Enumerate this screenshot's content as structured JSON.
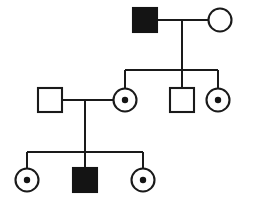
{
  "figure": {
    "type": "pedigree",
    "background_color": "#ffffff",
    "line_color": "#1a1a1a",
    "fill_affected_color": "#141414",
    "fill_unaffected_color": "#ffffff",
    "generations_count": "3",
    "inheritance_pattern": "X-linked recessive"
  },
  "legend": {
    "square_meaning": "male",
    "circle_meaning": "female",
    "filled_meaning": "affected",
    "open_meaning": "unaffected",
    "dot_meaning": "carrier"
  },
  "chart_data": {
    "type": "diagram",
    "generations": [
      {
        "id": "I",
        "label": "I",
        "y": 20,
        "individuals": [
          {
            "id": "I-1",
            "sex": "male",
            "shape": "square",
            "status": "affected",
            "carrier": "no",
            "fill": "#141414",
            "cx": 145,
            "cy": 20,
            "size": 24
          },
          {
            "id": "I-2",
            "sex": "female",
            "shape": "circle",
            "status": "unaffected",
            "carrier": "no",
            "fill": "#ffffff",
            "cx": 220,
            "cy": 20,
            "size": 24
          }
        ]
      },
      {
        "id": "II",
        "label": "II",
        "y": 100,
        "individuals": [
          {
            "id": "II-1",
            "sex": "male",
            "shape": "square",
            "status": "unaffected",
            "carrier": "no",
            "fill": "#ffffff",
            "cx": 50,
            "cy": 100,
            "size": 24
          },
          {
            "id": "II-2",
            "sex": "female",
            "shape": "circle",
            "status": "unaffected",
            "carrier": "yes",
            "fill": "#ffffff",
            "cx": 125,
            "cy": 100,
            "size": 24
          },
          {
            "id": "II-3",
            "sex": "male",
            "shape": "square",
            "status": "unaffected",
            "carrier": "no",
            "fill": "#ffffff",
            "cx": 182,
            "cy": 100,
            "size": 24
          },
          {
            "id": "II-4",
            "sex": "female",
            "shape": "circle",
            "status": "unaffected",
            "carrier": "yes",
            "fill": "#ffffff",
            "cx": 218,
            "cy": 100,
            "size": 24
          }
        ]
      },
      {
        "id": "III",
        "label": "III",
        "y": 180,
        "individuals": [
          {
            "id": "III-1",
            "sex": "female",
            "shape": "circle",
            "status": "unaffected",
            "carrier": "yes",
            "fill": "#ffffff",
            "cx": 27,
            "cy": 180,
            "size": 24
          },
          {
            "id": "III-2",
            "sex": "male",
            "shape": "square",
            "status": "affected",
            "carrier": "no",
            "fill": "#141414",
            "cx": 85,
            "cy": 180,
            "size": 24
          },
          {
            "id": "III-3",
            "sex": "female",
            "shape": "circle",
            "status": "unaffected",
            "carrier": "yes",
            "fill": "#ffffff",
            "cx": 143,
            "cy": 180,
            "size": 24
          }
        ]
      }
    ],
    "matings": [
      {
        "id": "mating-1",
        "partners": [
          "I-1",
          "I-2"
        ],
        "line_y": 20,
        "x_start": 157,
        "x_end": 208,
        "descent_x": 182,
        "descent_y_end": 70,
        "children": [
          "II-2",
          "II-3",
          "II-4"
        ],
        "sibship_bar_y": 70,
        "sibship_x_start": 125,
        "sibship_x_end": 218
      },
      {
        "id": "mating-2",
        "partners": [
          "II-1",
          "II-2"
        ],
        "line_y": 100,
        "x_start": 62,
        "x_end": 113,
        "descent_x": 85,
        "descent_y_end": 152,
        "children": [
          "III-1",
          "III-2",
          "III-3"
        ],
        "sibship_bar_y": 152,
        "sibship_x_start": 27,
        "sibship_x_end": 143
      }
    ]
  }
}
